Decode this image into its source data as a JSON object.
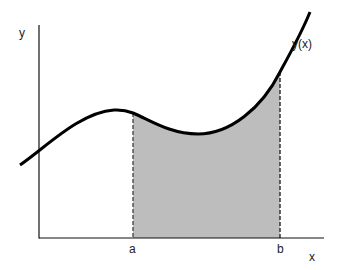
{
  "diagram": {
    "labels": {
      "y_axis": "y",
      "x_axis": "x",
      "curve": "y(x)",
      "lower_bound": "a",
      "upper_bound": "b"
    },
    "colors": {
      "curve": "#000000",
      "axes": "#111111",
      "shaded_area": "#bdbdbd",
      "bound_lines": "#333333",
      "background": "#ffffff"
    }
  }
}
